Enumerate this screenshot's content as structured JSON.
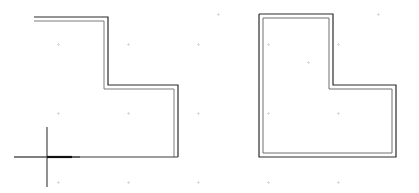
{
  "canvas": {
    "width": 419,
    "height": 193,
    "background_color": "#ffffff",
    "line_color": "#2b2b2b",
    "line_color_light": "#6e6e6e",
    "cursor_color": "#555555",
    "highlight_color": "#111111",
    "grid_dot_color": "#8a8a8a"
  },
  "shapes": [
    {
      "name": "left-open-l-outline",
      "type": "polyline-double-wall",
      "closed": false,
      "description": "L-shaped wall outline drawn with parallel double lines, open on the left and lower-left sides",
      "outer_points": "34,17 108,17 108,85 178,85 178,157",
      "inner_points": "34,21 104,21 104,89 174,89 174,157",
      "baseline_points": "47,157 178,157"
    },
    {
      "name": "right-closed-l-outline",
      "type": "polygon-double-wall",
      "closed": true,
      "description": "Closed L-shaped room polygon drawn with parallel double lines",
      "outer_points": "259,14 333,14 333,85 396,85 396,157 259,157 259,14",
      "inner_points": "263,18 329,18 329,89 392,89 392,153 263,153 263,18"
    }
  ],
  "cursor": {
    "name": "crosshair-cursor",
    "x": 47,
    "y": 157,
    "arm_up": 30,
    "arm_down": 30,
    "arm_left": 33,
    "arm_right": 33,
    "highlight_segment": {
      "from_x": 47,
      "to_x": 72,
      "y": 157
    }
  },
  "grid_dots": [
    {
      "x": 58,
      "y": 44
    },
    {
      "x": 128,
      "y": 44
    },
    {
      "x": 198,
      "y": 44
    },
    {
      "x": 268,
      "y": 44
    },
    {
      "x": 338,
      "y": 44
    },
    {
      "x": 58,
      "y": 113
    },
    {
      "x": 128,
      "y": 113
    },
    {
      "x": 198,
      "y": 113
    },
    {
      "x": 268,
      "y": 113
    },
    {
      "x": 338,
      "y": 113
    },
    {
      "x": 58,
      "y": 182
    },
    {
      "x": 128,
      "y": 182
    },
    {
      "x": 198,
      "y": 182
    },
    {
      "x": 268,
      "y": 182
    },
    {
      "x": 338,
      "y": 182
    },
    {
      "x": 378,
      "y": 14
    },
    {
      "x": 218,
      "y": 14
    },
    {
      "x": 308,
      "y": 62
    }
  ]
}
